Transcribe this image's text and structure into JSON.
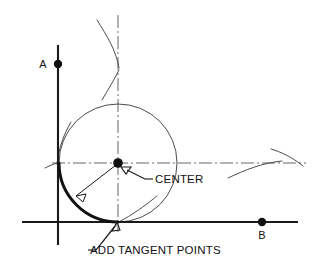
{
  "diagram": {
    "background_color": "#ffffff",
    "ink_color": "#111111",
    "construction_color": "#3a3a3a",
    "centerline_color": "#555555",
    "width": 313,
    "height": 279
  },
  "labels": {
    "point_a": "A",
    "point_b": "B",
    "center": "CENTER",
    "tangent_points": "ADD TANGENT POINTS"
  },
  "geometry": {
    "center_point": {
      "x": 118,
      "y": 163
    },
    "radius": 59,
    "tangent_point_vertical": {
      "x": 58,
      "y": 163
    },
    "tangent_point_horizontal": {
      "x": 118,
      "y": 222
    },
    "line_a": {
      "x1": 58,
      "y1": 45,
      "x2": 58,
      "y2": 245
    },
    "line_b": {
      "x1": 22,
      "y1": 222,
      "x2": 298,
      "y2": 222
    },
    "point_a_marker": {
      "x": 58,
      "y": 64
    },
    "point_b_marker": {
      "x": 262,
      "y": 222
    },
    "centerline_vertical": {
      "x": 118,
      "y1": 15,
      "y2": 232
    },
    "centerline_horizontal": {
      "y": 163,
      "x1": 52,
      "x2": 306
    }
  }
}
